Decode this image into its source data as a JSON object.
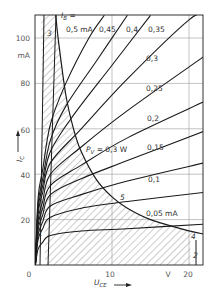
{
  "chart_data": {
    "type": "line",
    "title": "",
    "xlabel": "U_CE",
    "xunit": "V",
    "ylabel": "I_C",
    "yunit": "mA",
    "xlim": [
      0,
      22
    ],
    "ylim": [
      0,
      110
    ],
    "x_ticks": [
      "0",
      "10",
      "20"
    ],
    "x_unit_label": "V",
    "y_ticks": [
      "20",
      "40",
      "60",
      "80",
      "100"
    ],
    "y_unit_label": "mA",
    "grid": true,
    "parameter_label": "I_B =",
    "series": [
      {
        "name": "0,5 mA",
        "label": "0,5 mA",
        "points": [
          [
            1,
            42
          ],
          [
            2,
            62
          ],
          [
            4,
            80
          ],
          [
            7,
            100
          ],
          [
            9,
            110
          ]
        ]
      },
      {
        "name": "0,45",
        "label": "0,45",
        "points": [
          [
            1,
            38
          ],
          [
            2,
            55
          ],
          [
            4,
            70
          ],
          [
            8,
            90
          ],
          [
            12,
            110
          ]
        ]
      },
      {
        "name": "0,4",
        "label": "0,4",
        "points": [
          [
            1,
            35
          ],
          [
            2,
            50
          ],
          [
            5,
            66
          ],
          [
            10,
            88
          ],
          [
            15,
            110
          ]
        ]
      },
      {
        "name": "0,35",
        "label": "0,35",
        "points": [
          [
            1,
            32
          ],
          [
            2,
            45
          ],
          [
            6,
            60
          ],
          [
            12,
            82
          ],
          [
            20,
            108
          ],
          [
            22,
            110
          ]
        ]
      },
      {
        "name": "0,3",
        "label": "0,3",
        "points": [
          [
            1,
            28
          ],
          [
            2,
            40
          ],
          [
            6,
            52
          ],
          [
            12,
            68
          ],
          [
            22,
            92
          ]
        ]
      },
      {
        "name": "0,25",
        "label": "0,25",
        "points": [
          [
            1,
            25
          ],
          [
            2,
            35
          ],
          [
            6,
            44
          ],
          [
            12,
            56
          ],
          [
            22,
            72
          ]
        ]
      },
      {
        "name": "0,2",
        "label": "0,2",
        "points": [
          [
            1,
            22
          ],
          [
            2,
            31
          ],
          [
            6,
            38
          ],
          [
            12,
            46
          ],
          [
            22,
            59
          ]
        ]
      },
      {
        "name": "0,15",
        "label": "0,15",
        "points": [
          [
            1,
            19
          ],
          [
            2,
            26
          ],
          [
            6,
            31
          ],
          [
            12,
            37
          ],
          [
            22,
            45
          ]
        ]
      },
      {
        "name": "0,1",
        "label": "0,1",
        "points": [
          [
            1,
            16
          ],
          [
            2,
            21
          ],
          [
            6,
            25
          ],
          [
            12,
            28
          ],
          [
            22,
            32
          ]
        ]
      },
      {
        "name": "0,05 mA",
        "label": "0,05 mA",
        "points": [
          [
            1,
            10
          ],
          [
            2,
            13
          ],
          [
            6,
            15
          ],
          [
            12,
            16
          ],
          [
            22,
            18
          ]
        ]
      }
    ],
    "power_hyperbola": {
      "label": "P_V = 0,3 W",
      "points": [
        [
          2.7,
          110
        ],
        [
          3,
          100
        ],
        [
          4,
          75
        ],
        [
          5,
          60
        ],
        [
          6,
          50
        ],
        [
          8,
          37.5
        ],
        [
          10,
          30
        ],
        [
          12,
          25
        ],
        [
          15,
          20
        ],
        [
          20,
          15
        ],
        [
          22,
          13.6
        ]
      ]
    },
    "region_labels": [
      "1",
      "2",
      "3",
      "4",
      "5"
    ],
    "annotations": {
      "region_3": "3",
      "region_4": "4",
      "region_5": "5",
      "region_2": "2",
      "region_1": "1"
    }
  },
  "labels": {
    "ib_prefix": "I",
    "ib_sub": "B",
    "ib_eq": " =",
    "pv_prefix": "P",
    "pv_sub": "V",
    "pv_value": " = 0,3 W",
    "ic": "I",
    "ic_sub": "C",
    "uce": "U",
    "uce_sub": "CE",
    "curve_labels": [
      "0,5 mA",
      "0,45",
      "0,4",
      "0,35",
      "0,3",
      "0,25",
      "0,2",
      "0,15",
      "0,1",
      "0,05 mA"
    ],
    "x_ticks": [
      "0",
      "10",
      "20"
    ],
    "x_unit": "V",
    "y_ticks": [
      "100",
      "80",
      "60",
      "40",
      "20"
    ],
    "y_unit": "mA",
    "region_3": "3",
    "region_4": "4",
    "region_5": "5",
    "region_2": "2",
    "region_1": "1"
  }
}
